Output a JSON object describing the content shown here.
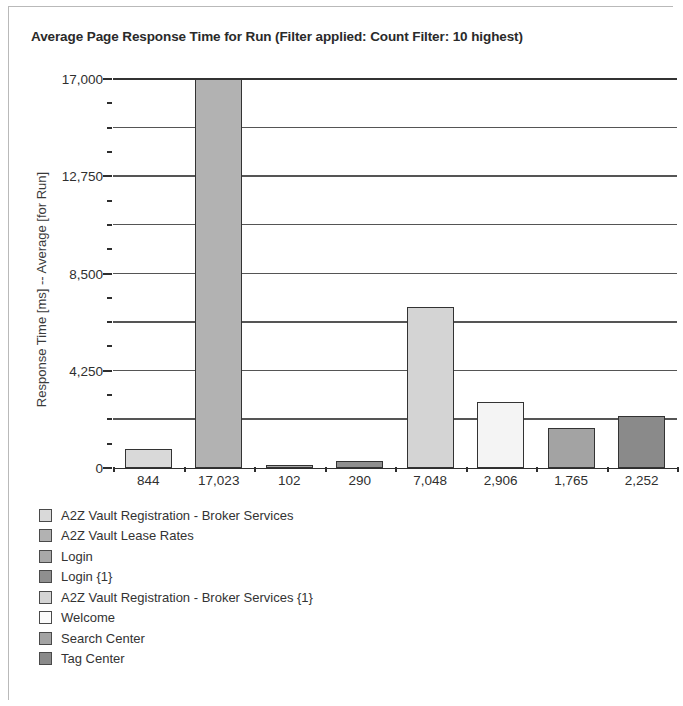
{
  "panel": {
    "border_color": "#b9b9b9",
    "background": "#ffffff"
  },
  "chart_data": {
    "type": "bar",
    "title": "Average Page Response Time for Run (Filter applied: Count Filter: 10 highest)",
    "xlabel": "",
    "ylabel": "Response Time [ms] -- Average [for Run]",
    "ylim": [
      0,
      17000
    ],
    "ytick_labels": [
      "0",
      "4,250",
      "8,500",
      "12,750",
      "17,000"
    ],
    "ytick_values": [
      0,
      4250,
      8500,
      12750,
      17000
    ],
    "minor_ticks": true,
    "grid": true,
    "grid_color": "#555555",
    "axis_color": "#2e2e2e",
    "legend_position": "below",
    "categories": [
      "A2Z Vault Registration - Broker Services",
      "A2Z Vault Lease Rates",
      "Login",
      "Login {1}",
      "A2Z Vault Registration - Broker Services {1}",
      "Welcome",
      "Search Center",
      "Tag Center"
    ],
    "values": [
      844,
      17023,
      102,
      290,
      7048,
      2906,
      1765,
      2252
    ],
    "value_labels": [
      "844",
      "17,023",
      "102",
      "290",
      "7,048",
      "2,906",
      "1,765",
      "2,252"
    ],
    "colors": [
      "#d9d9d9",
      "#b2b2b2",
      "#a8a8a8",
      "#8f8f8f",
      "#d4d4d4",
      "#f4f4f4",
      "#a3a3a3",
      "#8a8a8a"
    ],
    "bar_edge_color": "#333333"
  },
  "legend": {
    "items": [
      {
        "label": "A2Z Vault Registration - Broker Services",
        "color": "#d9d9d9"
      },
      {
        "label": "A2Z Vault Lease Rates",
        "color": "#b2b2b2"
      },
      {
        "label": "Login",
        "color": "#a8a8a8"
      },
      {
        "label": "Login {1}",
        "color": "#8f8f8f"
      },
      {
        "label": "A2Z Vault Registration - Broker Services {1}",
        "color": "#d4d4d4"
      },
      {
        "label": "Welcome",
        "color": "#fbfbfb"
      },
      {
        "label": "Search Center",
        "color": "#a3a3a3"
      },
      {
        "label": "Tag Center",
        "color": "#8a8a8a"
      }
    ]
  }
}
